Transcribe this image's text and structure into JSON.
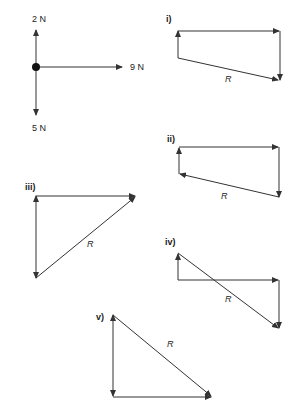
{
  "header": {
    "cut_text": ""
  },
  "forces": {
    "up": "2 N",
    "right": "9 N",
    "down": "5 N"
  },
  "diagrams": [
    {
      "id": "i",
      "label": "i)",
      "resultant": "R"
    },
    {
      "id": "ii",
      "label": "ii)",
      "resultant": "R"
    },
    {
      "id": "iii",
      "label": "iii)",
      "resultant": "R"
    },
    {
      "id": "iv",
      "label": "iv)",
      "resultant": "R"
    },
    {
      "id": "v",
      "label": "v)",
      "resultant": "R"
    }
  ],
  "colors": {
    "line": "#333333"
  }
}
